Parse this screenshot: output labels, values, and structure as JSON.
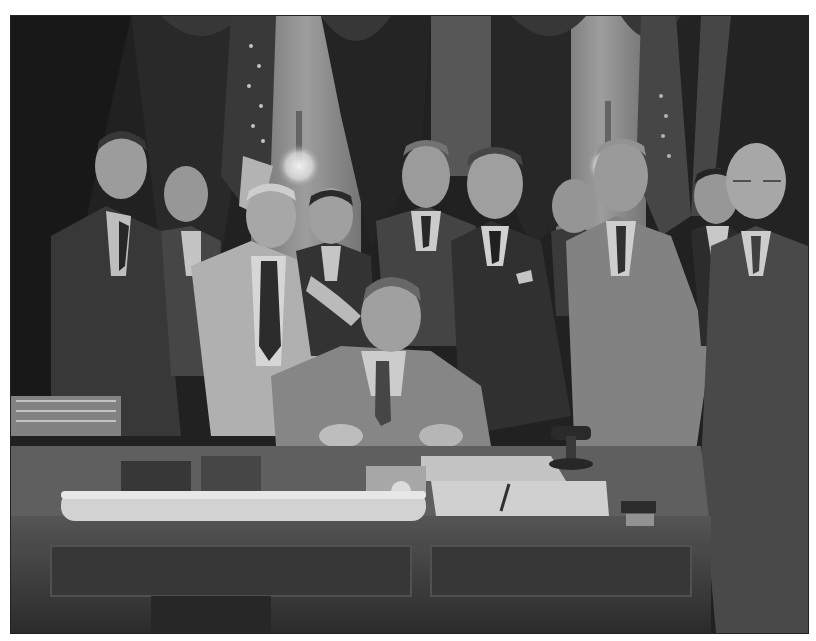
{
  "photo": {
    "type": "black-and-white historical photograph",
    "scene": "Seated man signing documents at a desk surrounded by standing men in suits",
    "frame": {
      "x": 10,
      "y": 15,
      "width": 797,
      "height": 617,
      "border_color": "#222222",
      "margin_color": "#ffffff"
    },
    "palette": {
      "background_dark": "#1e1e1e",
      "curtain": "#2b2b2b",
      "wall_light": "#9a9a9a",
      "suit_dark": "#3a3a3a",
      "suit_mid": "#6c6c6c",
      "suit_light": "#b9b9b9",
      "skin": "#a8a8a8",
      "desk": "#3c3c3c",
      "desk_top": "#6f6f6f",
      "paper": "#d8d8d8",
      "lamp_glow": "#f4f4f4"
    },
    "objects": [
      "draped curtains",
      "american flags",
      "wall lamps",
      "wooden desk",
      "candlestick telephone",
      "rolled document",
      "papers and folder",
      "wire letter tray",
      "pen"
    ],
    "people_count": 12
  }
}
